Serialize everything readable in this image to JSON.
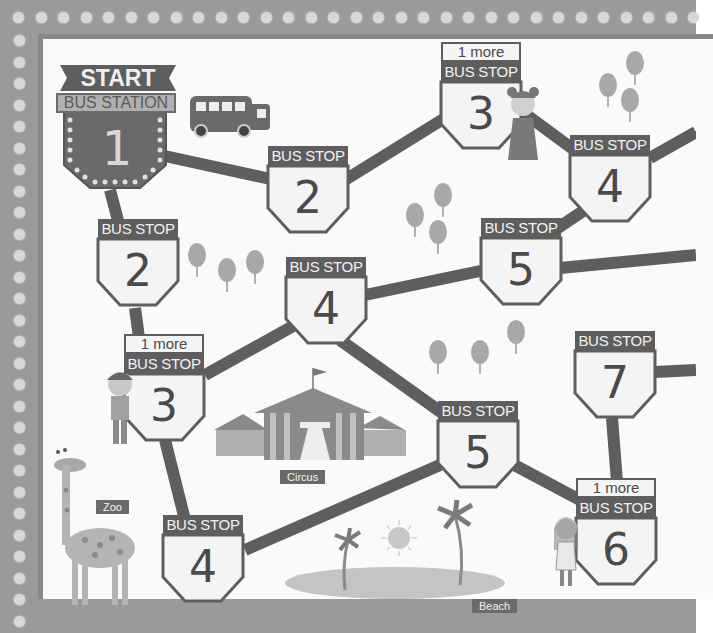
{
  "game": {
    "title": "Bus Route Board Game",
    "start_banner": "START",
    "station_label": "BUS STATION",
    "station_number": "1"
  },
  "stops": [
    {
      "id": "route-top-2",
      "header": "BUS STOP",
      "number": "2",
      "bonus": null
    },
    {
      "id": "route-top-3",
      "header": "BUS STOP",
      "number": "3",
      "bonus": "1 more"
    },
    {
      "id": "route-top-4",
      "header": "BUS STOP",
      "number": "4",
      "bonus": null
    },
    {
      "id": "route-mid-5",
      "header": "BUS STOP",
      "number": "5",
      "bonus": null
    },
    {
      "id": "route-left-2",
      "header": "BUS STOP",
      "number": "2",
      "bonus": null
    },
    {
      "id": "route-mid-4",
      "header": "BUS STOP",
      "number": "4",
      "bonus": null
    },
    {
      "id": "route-left-3",
      "header": "BUS STOP",
      "number": "3",
      "bonus": "1 more"
    },
    {
      "id": "route-low-5",
      "header": "BUS STOP",
      "number": "5",
      "bonus": null
    },
    {
      "id": "route-right-7",
      "header": "BUS STOP",
      "number": "7",
      "bonus": null
    },
    {
      "id": "route-right-6",
      "header": "BUS STOP",
      "number": "6",
      "bonus": "1 more"
    },
    {
      "id": "route-bottom-4",
      "header": "BUS STOP",
      "number": "4",
      "bonus": null
    }
  ],
  "landmarks": {
    "circus": "Circus",
    "zoo": "Zoo",
    "beach": "Beach"
  },
  "colors": {
    "frame": "#9a9a9a",
    "road": "#5e5e5e",
    "sign_header": "#5e5e5e",
    "sign_body": "#f4f4f4",
    "station_body": "#6a6a6a",
    "tree": "#a8a8a8",
    "background": "#fafafa"
  }
}
